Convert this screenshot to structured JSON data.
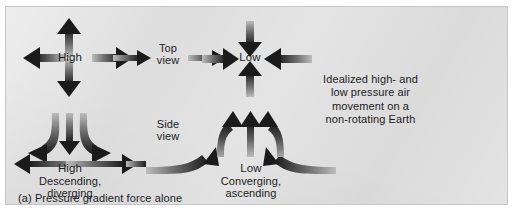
{
  "figure": {
    "id_label": "(a)",
    "caption_bottom": "(a) Pressure gradient force alone",
    "panel_color": "#d9d9d9",
    "ink_color": "#1b1b1b"
  },
  "top_view": {
    "view_label": "Top\nview",
    "high_label": "High",
    "low_label": "Low",
    "high_arrows": [
      {
        "name": "high-arrow-up",
        "direction": "up"
      },
      {
        "name": "high-arrow-down",
        "direction": "down"
      },
      {
        "name": "high-arrow-left",
        "direction": "left"
      },
      {
        "name": "high-arrow-right",
        "direction": "right"
      }
    ],
    "low_arrows": [
      {
        "name": "low-arrow-from-top",
        "direction": "down"
      },
      {
        "name": "low-arrow-from-bottom",
        "direction": "up"
      },
      {
        "name": "low-arrow-from-left",
        "direction": "right"
      },
      {
        "name": "low-arrow-from-right",
        "direction": "left"
      }
    ],
    "connector_left": "arrow-right",
    "connector_right": "arrow-right"
  },
  "side_view": {
    "view_label": "Side\nview",
    "high_label": "High",
    "high_sub": "Descending,\ndiverging",
    "low_label": "Low",
    "low_sub": "Converging,\nascending",
    "high_flow": "air descends then diverges outward at the surface",
    "low_flow": "air converges at the surface then ascends"
  },
  "annotation": {
    "text": "Idealized high- and\nlow pressure air\nmovement on a\nnon-rotating Earth"
  }
}
